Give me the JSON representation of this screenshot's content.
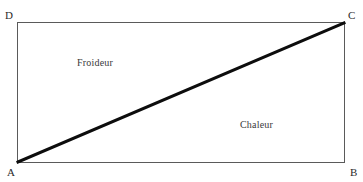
{
  "figure": {
    "name": "rectangle-diagonal-diagram",
    "background_color": "#ffffff",
    "frame": {
      "border_color": "#5a5a5a",
      "fill_color": "#ffffff"
    },
    "diagonal": {
      "from_vertex": "A",
      "to_vertex": "C",
      "color": "#0d0d0d",
      "thickness_px": 3
    },
    "vertices": [
      {
        "key": "d",
        "label": "D",
        "position": "top-left"
      },
      {
        "key": "c",
        "label": "C",
        "position": "top-right"
      },
      {
        "key": "a",
        "label": "A",
        "position": "bottom-left"
      },
      {
        "key": "b",
        "label": "B",
        "position": "bottom-right"
      }
    ],
    "regions": [
      {
        "key": "upper",
        "label": "Froideur",
        "position": "upper-left-triangle"
      },
      {
        "key": "lower",
        "label": "Chaleur",
        "position": "lower-right-triangle"
      }
    ]
  }
}
